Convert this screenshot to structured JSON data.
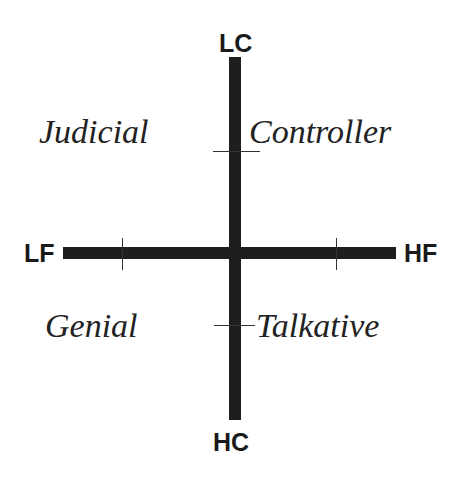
{
  "diagram": {
    "type": "quadrant",
    "axes": {
      "vertical": {
        "top_label": "LC",
        "bottom_label": "HC"
      },
      "horizontal": {
        "left_label": "LF",
        "right_label": "HF"
      }
    },
    "quadrants": {
      "top_left": "Judicial",
      "top_right": "Controller",
      "bottom_left": "Genial",
      "bottom_right": "Talkative"
    },
    "colors": {
      "axis": "#1e1e1e",
      "text": "#222222",
      "background": "#ffffff"
    }
  }
}
